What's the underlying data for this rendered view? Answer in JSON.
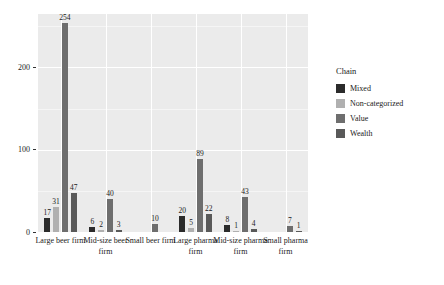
{
  "chart_data": {
    "type": "bar",
    "title": "",
    "subtitle": "",
    "xlabel": "",
    "ylabel": "",
    "ylim": [
      0,
      265
    ],
    "yticks": [
      0,
      100,
      200
    ],
    "ytick_labels": [
      "0",
      "100",
      "200"
    ],
    "grid": true,
    "grid_axis": "both",
    "legend_position": "right",
    "legend_title": "Chain",
    "bar_labels_shown": true,
    "categories": [
      "Large beer firm",
      "Mid-size beer firm",
      "Small beer firm",
      "Large pharma firm",
      "Mid-size pharma firm",
      "Small pharma firm"
    ],
    "series": [
      {
        "name": "Mixed",
        "color": "#2b2b2b",
        "values": [
          17,
          6,
          0,
          20,
          8,
          0
        ],
        "labels": [
          "17",
          "6",
          "",
          "20",
          "8",
          ""
        ]
      },
      {
        "name": "Non-categorized",
        "color": "#b0b0b0",
        "values": [
          31,
          2,
          0,
          5,
          1,
          0
        ],
        "labels": [
          "31",
          "2",
          "",
          "5",
          "1",
          ""
        ]
      },
      {
        "name": "Value",
        "color": "#6e6e6e",
        "values": [
          254,
          40,
          10,
          89,
          43,
          7
        ],
        "labels": [
          "254",
          "40",
          "10",
          "89",
          "43",
          "7"
        ]
      },
      {
        "name": "Wealth",
        "color": "#595959",
        "values": [
          47,
          3,
          0,
          22,
          4,
          1
        ],
        "labels": [
          "47",
          "3",
          "",
          "22",
          "4",
          "1"
        ]
      }
    ]
  },
  "legend": {
    "title": "Chain",
    "items": [
      {
        "label": "Mixed",
        "color": "#2b2b2b"
      },
      {
        "label": "Non-categorized",
        "color": "#b0b0b0"
      },
      {
        "label": "Value",
        "color": "#6e6e6e"
      },
      {
        "label": "Wealth",
        "color": "#595959"
      }
    ]
  },
  "axes": {
    "y_tick_labels": [
      "200",
      "100",
      "0"
    ],
    "x_tick_labels": [
      "Large beer firm",
      "Mid-size beer firm",
      "Small beer firm",
      "Large pharma firm",
      "Mid-size pharma firm",
      "Small pharma firm"
    ]
  },
  "colors": {
    "panel_background": "#ebebeb",
    "figure_background": "#ffffff",
    "gridline_major": "#ffffff",
    "text": "#1a1a1a"
  }
}
